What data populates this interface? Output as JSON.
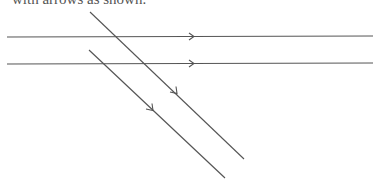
{
  "caption": "with arrows as shown.",
  "colors": {
    "line": "#555555"
  },
  "lines": {
    "horizontal_1": {
      "x1": 7,
      "y1": 37,
      "x2": 373,
      "y2": 36,
      "arrow": {
        "x": 193,
        "y": 36.5,
        "dir": "right"
      }
    },
    "horizontal_2": {
      "x1": 7,
      "y1": 64,
      "x2": 373,
      "y2": 63,
      "arrow": {
        "x": 193,
        "y": 63.5,
        "dir": "right"
      }
    },
    "diagonal_1": {
      "x1": 90,
      "y1": 12,
      "x2": 244,
      "y2": 159,
      "arrow": {
        "x": 176,
        "y": 93,
        "dir": "down-right"
      }
    },
    "diagonal_2": {
      "x1": 89,
      "y1": 50,
      "x2": 225,
      "y2": 178,
      "arrow": {
        "x": 153,
        "y": 110,
        "dir": "down-right"
      }
    }
  }
}
